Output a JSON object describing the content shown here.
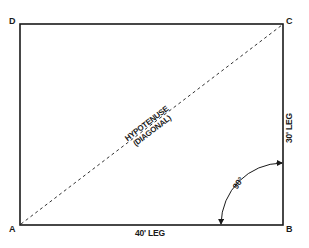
{
  "diagram": {
    "vertices": [
      {
        "id": "D",
        "label": "D"
      },
      {
        "id": "C",
        "label": "C"
      },
      {
        "id": "A",
        "label": "A"
      },
      {
        "id": "B",
        "label": "B"
      }
    ],
    "sides": {
      "bottom": {
        "label": "40' LEG",
        "length": 40,
        "unit": "ft"
      },
      "right": {
        "label": "30' LEG",
        "length": 30,
        "unit": "ft"
      }
    },
    "diagonal": {
      "line1": "HYPOTENUSE",
      "line2": "(DIAGONAL)",
      "from": "A",
      "to": "C",
      "style": "dashed"
    },
    "angle": {
      "label": "90°",
      "vertex": "B",
      "value": 90
    },
    "colors": {
      "stroke": "#1a1a1a",
      "background": "#ffffff"
    }
  }
}
